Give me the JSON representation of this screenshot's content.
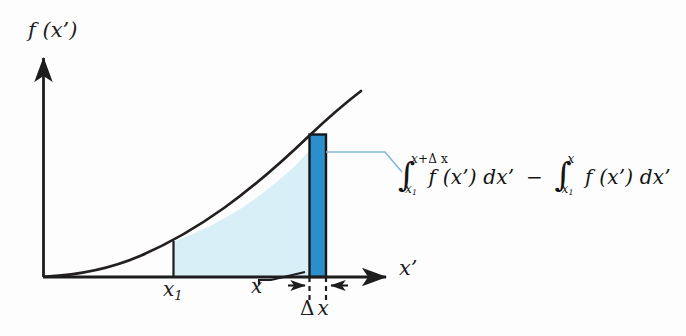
{
  "figure": {
    "kind": "calculus-integral-diagram",
    "background_color": "#fdfdfd",
    "axes": {
      "y_label": "f (x’)",
      "x_label": "x’",
      "axis_color": "#1d1d1d",
      "origin_px": [
        43,
        277
      ],
      "x_axis_end_px": [
        392,
        277
      ],
      "y_axis_top_px": [
        43,
        55
      ]
    },
    "curve": {
      "description": "increasing convex curve f(x’) rising from origin",
      "color": "#231f20",
      "start_px": [
        47,
        276
      ],
      "end_px": [
        362,
        91
      ]
    },
    "shaded_region": {
      "label": "area under curve from x1 to x",
      "fill_color": "#d8eff7",
      "left_px": 173,
      "right_px": 309
    },
    "slab": {
      "label": "thin strip of width delta-x",
      "fill_color": "#2b8fcc",
      "stroke_color": "#14181a",
      "left_px": 309,
      "right_px": 326,
      "top_px": 134,
      "bottom_px": 277
    },
    "leader": {
      "color": "#7fb8d8",
      "from_px": [
        326,
        152
      ],
      "to_px": [
        400,
        173
      ]
    },
    "tick_x1": {
      "label": "x₁",
      "base_text": "x",
      "sub_text": "1",
      "x_px": 173,
      "top_px": 242
    },
    "tick_x": {
      "label": "x",
      "x_px": 309
    },
    "delta_x": {
      "label": "Δ x",
      "delta_symbol": "Δ",
      "var_symbol": "x",
      "left_px": 309,
      "right_px": 326
    }
  },
  "formula": {
    "full_text": "∫ from x₁ to x+Δx of f(x’) dx’ − ∫ from x₁ to x of f(x’) dx’",
    "integral_sign": "∫",
    "term1": {
      "upper_limit_base": "x+",
      "upper_limit_delta": "Δ x",
      "lower_limit_base": "x",
      "lower_limit_sub": "1",
      "integrand": "f (x’) dx’"
    },
    "operator": "−",
    "term2": {
      "upper_limit": "x",
      "lower_limit_base": "x",
      "lower_limit_sub": "1",
      "integrand": "f (x’) dx’"
    }
  }
}
